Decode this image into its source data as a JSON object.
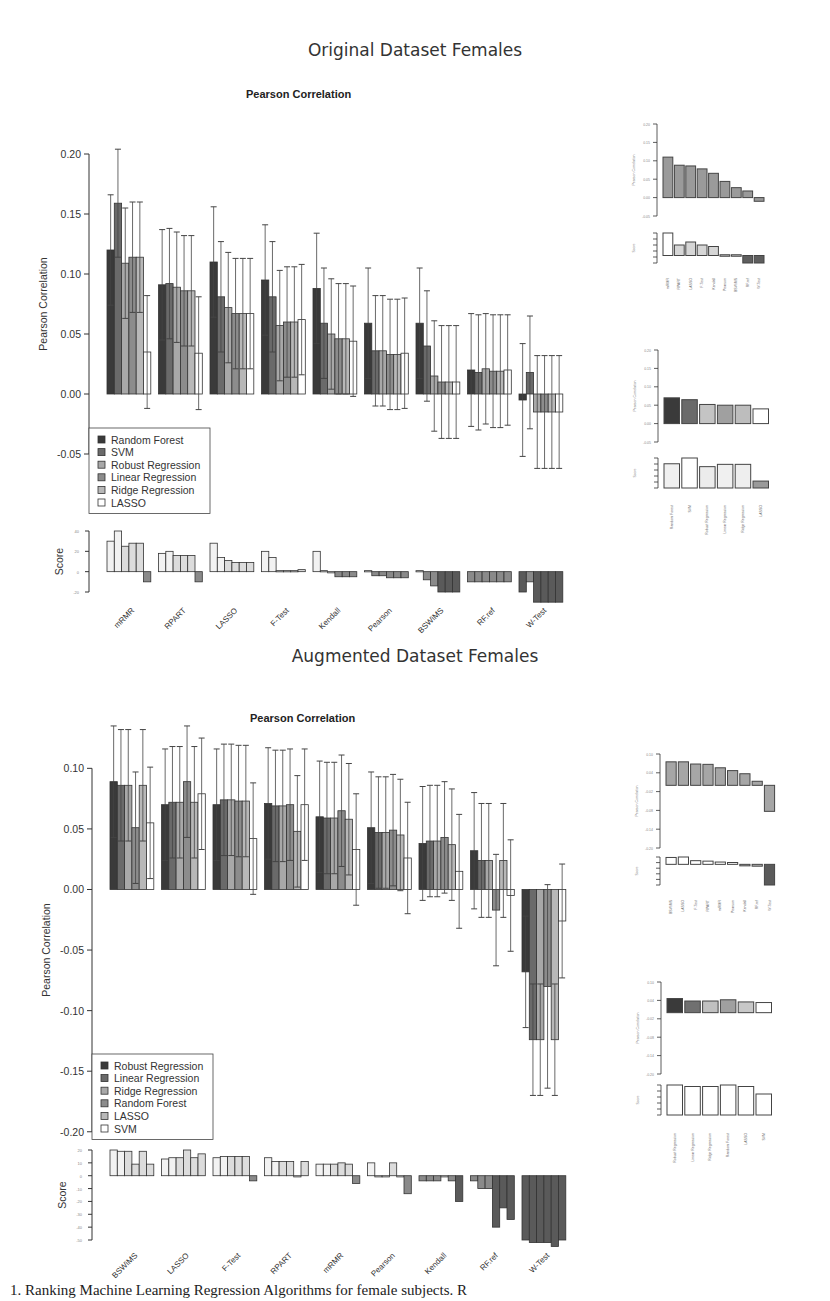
{
  "figure": {
    "sections": [
      {
        "title": "Original Dataset Females",
        "plot_title": "Pearson Correlation"
      },
      {
        "title": "Augmented Dataset Females",
        "plot_title": "Pearson Correlation"
      }
    ],
    "caption": "1. Ranking Machine Learning Regression Algorithms for female subjects. R"
  },
  "colors": {
    "c1": "#3a3a3a",
    "c2": "#6a6a6a",
    "c3": "#a8a8a8",
    "c4": "#8c8c8c",
    "c5": "#b8b8b8",
    "c6": "#ffffff",
    "axis": "#333333"
  },
  "chart_data": [
    {
      "type": "bar",
      "title": "Pearson Correlation",
      "section": "Original Dataset Females",
      "xlabel": "",
      "ylabel": "Pearson Correlation",
      "ylim": [
        -0.075,
        0.2
      ],
      "yticks": [
        0.2,
        0.15,
        0.1,
        0.05,
        0.0,
        -0.05
      ],
      "legend_position": "bottom-left",
      "categories": [
        "mRMR",
        "RPART",
        "LASSO",
        "F-Test",
        "Kendall",
        "Pearson",
        "BSWiMS",
        "RF.ref",
        "W-Test"
      ],
      "series": [
        {
          "name": "Random Forest",
          "color": "#3a3a3a",
          "values": [
            0.12,
            0.091,
            0.11,
            0.095,
            0.088,
            0.059,
            0.059,
            0.02,
            -0.005
          ],
          "err": [
            0.046,
            0.046,
            0.046,
            0.046,
            0.046,
            0.046,
            0.046,
            0.047,
            0.047
          ]
        },
        {
          "name": "SVM",
          "color": "#6a6a6a",
          "values": [
            0.159,
            0.092,
            0.081,
            0.081,
            0.059,
            0.036,
            0.04,
            0.018,
            0.018
          ],
          "err": [
            0.045,
            0.046,
            0.046,
            0.046,
            0.046,
            0.046,
            0.046,
            0.048,
            0.047
          ]
        },
        {
          "name": "Robust Regression",
          "color": "#a8a8a8",
          "values": [
            0.109,
            0.089,
            0.072,
            0.057,
            0.05,
            0.036,
            0.015,
            0.021,
            -0.015
          ],
          "err": [
            0.046,
            0.046,
            0.046,
            0.046,
            0.046,
            0.046,
            0.046,
            0.046,
            0.047
          ]
        },
        {
          "name": "Linear Regression",
          "color": "#8c8c8c",
          "values": [
            0.114,
            0.086,
            0.067,
            0.06,
            0.046,
            0.033,
            0.01,
            0.019,
            -0.015
          ],
          "err": [
            0.046,
            0.046,
            0.046,
            0.046,
            0.046,
            0.046,
            0.047,
            0.047,
            0.047
          ]
        },
        {
          "name": "Ridge Regression",
          "color": "#b8b8b8",
          "values": [
            0.114,
            0.086,
            0.067,
            0.06,
            0.046,
            0.033,
            0.01,
            0.019,
            -0.015
          ],
          "err": [
            0.046,
            0.046,
            0.046,
            0.046,
            0.046,
            0.046,
            0.047,
            0.047,
            0.047
          ]
        },
        {
          "name": "LASSO",
          "color": "#ffffff",
          "values": [
            0.035,
            0.034,
            0.067,
            0.062,
            0.044,
            0.034,
            0.01,
            0.02,
            -0.015
          ],
          "err": [
            0.047,
            0.047,
            0.046,
            0.046,
            0.046,
            0.046,
            0.047,
            0.046,
            0.047
          ]
        }
      ],
      "score_panel": {
        "ylabel": "Score",
        "ylim": [
          -20,
          40
        ],
        "values": [
          [
            30,
            40,
            25,
            28,
            28,
            -10
          ],
          [
            18,
            20,
            16,
            16,
            16,
            -10
          ],
          [
            28,
            14,
            11,
            9,
            9,
            9
          ],
          [
            20,
            14,
            1,
            1,
            1,
            2
          ],
          [
            20,
            1,
            0,
            -5,
            -5,
            -5
          ],
          [
            1,
            -4,
            -4,
            -6,
            -6,
            -6
          ],
          [
            1,
            -8,
            -14,
            -20,
            -20,
            -20
          ],
          [
            -10,
            -10,
            -10,
            -10,
            -10,
            -10
          ],
          [
            -20,
            -10,
            -30,
            -30,
            -30,
            -30
          ]
        ]
      }
    },
    {
      "type": "bar",
      "title": "Feature selection ranking (inset)",
      "section": "Original Dataset Females",
      "ylabel": "Pearson Correlation",
      "ylim": [
        -0.05,
        0.2
      ],
      "categories": [
        "mRMR",
        "RPART",
        "LASSO",
        "F-Test",
        "Kendall",
        "Pearson",
        "BSWiMS",
        "RF.ref",
        "W-Test"
      ],
      "values": [
        0.11,
        0.088,
        0.086,
        0.078,
        0.066,
        0.044,
        0.027,
        0.018,
        -0.01
      ],
      "score_values": [
        30,
        14,
        18,
        14,
        12,
        1,
        1,
        -10,
        -10
      ]
    },
    {
      "type": "bar",
      "title": "Regression algorithm ranking (inset)",
      "section": "Original Dataset Females",
      "ylabel": "Pearson Correlation",
      "ylim": [
        -0.05,
        0.2
      ],
      "categories": [
        "Random Forest",
        "SVM",
        "Robust Regression",
        "Linear Regression",
        "Ridge Regression",
        "LASSO"
      ],
      "values": [
        0.07,
        0.065,
        0.052,
        0.05,
        0.05,
        0.04
      ],
      "score_values": [
        42,
        52,
        37,
        41,
        41,
        12
      ]
    },
    {
      "type": "bar",
      "title": "Pearson Correlation",
      "section": "Augmented Dataset Females",
      "xlabel": "",
      "ylabel": "Pearson Correlation",
      "ylim": [
        -0.22,
        0.13
      ],
      "yticks": [
        0.1,
        0.05,
        0.0,
        -0.05,
        -0.1,
        -0.15,
        -0.2
      ],
      "legend_position": "bottom-left",
      "categories": [
        "BSWiMS",
        "LASSO",
        "F-Test",
        "RPART",
        "mRMR",
        "Pearson",
        "Kendall",
        "RF.ref",
        "W-Test"
      ],
      "series": [
        {
          "name": "Robust Regression",
          "color": "#3a3a3a",
          "values": [
            0.089,
            0.07,
            0.07,
            0.071,
            0.06,
            0.051,
            0.038,
            0.032,
            -0.068
          ],
          "err": [
            0.046,
            0.046,
            0.046,
            0.046,
            0.046,
            0.046,
            0.047,
            0.048,
            0.046
          ]
        },
        {
          "name": "Linear Regression",
          "color": "#6a6a6a",
          "values": [
            0.086,
            0.072,
            0.074,
            0.069,
            0.059,
            0.047,
            0.04,
            0.024,
            -0.124
          ],
          "err": [
            0.046,
            0.046,
            0.046,
            0.046,
            0.046,
            0.046,
            0.046,
            0.047,
            0.046
          ]
        },
        {
          "name": "Ridge Regression",
          "color": "#a8a8a8",
          "values": [
            0.086,
            0.072,
            0.074,
            0.069,
            0.059,
            0.047,
            0.04,
            0.024,
            -0.124
          ],
          "err": [
            0.046,
            0.046,
            0.046,
            0.046,
            0.046,
            0.046,
            0.046,
            0.047,
            0.046
          ]
        },
        {
          "name": "Random Forest",
          "color": "#8c8c8c",
          "values": [
            0.051,
            0.089,
            0.073,
            0.07,
            0.065,
            0.049,
            0.043,
            -0.017,
            -0.08
          ],
          "err": [
            0.046,
            0.046,
            0.046,
            0.046,
            0.046,
            0.046,
            0.046,
            0.046,
            0.084
          ]
        },
        {
          "name": "LASSO",
          "color": "#b8b8b8",
          "values": [
            0.086,
            0.072,
            0.073,
            0.048,
            0.058,
            0.045,
            0.037,
            0.024,
            -0.124
          ],
          "err": [
            0.046,
            0.046,
            0.046,
            0.046,
            0.046,
            0.046,
            0.046,
            0.047,
            0.046
          ]
        },
        {
          "name": "SVM",
          "color": "#ffffff",
          "values": [
            0.055,
            0.079,
            0.042,
            0.07,
            0.033,
            0.026,
            0.015,
            -0.005,
            -0.026
          ],
          "err": [
            0.046,
            0.046,
            0.046,
            0.046,
            0.046,
            0.046,
            0.047,
            0.046,
            0.047
          ]
        }
      ],
      "score_panel": {
        "ylabel": "Score",
        "ylim": [
          -50,
          20
        ],
        "values": [
          [
            20,
            19,
            19,
            9,
            19,
            9
          ],
          [
            13,
            14,
            14,
            20,
            14,
            17
          ],
          [
            14,
            15,
            15,
            15,
            15,
            -4
          ],
          [
            14,
            11,
            11,
            11,
            0,
            11
          ],
          [
            9,
            9,
            9,
            10,
            9,
            -6
          ],
          [
            10,
            0,
            0,
            10,
            0,
            -14
          ],
          [
            -4,
            -4,
            -4,
            0,
            -4,
            -20
          ],
          [
            -4,
            -10,
            -10,
            -40,
            -25,
            -34
          ],
          [
            -50,
            -52,
            -52,
            -52,
            -55,
            -50
          ]
        ]
      }
    },
    {
      "type": "bar",
      "title": "Feature selection ranking (inset)",
      "section": "Augmented Dataset Females",
      "ylabel": "Pearson Correlation",
      "ylim": [
        -0.2,
        0.1
      ],
      "categories": [
        "BSWiMS",
        "LASSO",
        "F-Test",
        "RPART",
        "mRMR",
        "Pearson",
        "Kendall",
        "RF.ref",
        "W-Test"
      ],
      "values": [
        0.075,
        0.075,
        0.068,
        0.067,
        0.056,
        0.047,
        0.037,
        0.013,
        -0.083
      ],
      "score_values": [
        15,
        16,
        8,
        7,
        5,
        4,
        0,
        -4,
        -45
      ]
    },
    {
      "type": "bar",
      "title": "Regression algorithm ranking (inset)",
      "section": "Augmented Dataset Females",
      "ylabel": "Pearson Correlation",
      "ylim": [
        -0.2,
        0.1
      ],
      "categories": [
        "Robust Regression",
        "Linear Regression",
        "Ridge Regression",
        "Random Forest",
        "LASSO",
        "SVM"
      ],
      "values": [
        0.046,
        0.038,
        0.038,
        0.042,
        0.035,
        0.033
      ],
      "score_values": [
        20,
        19,
        19,
        20,
        19,
        14
      ]
    }
  ]
}
